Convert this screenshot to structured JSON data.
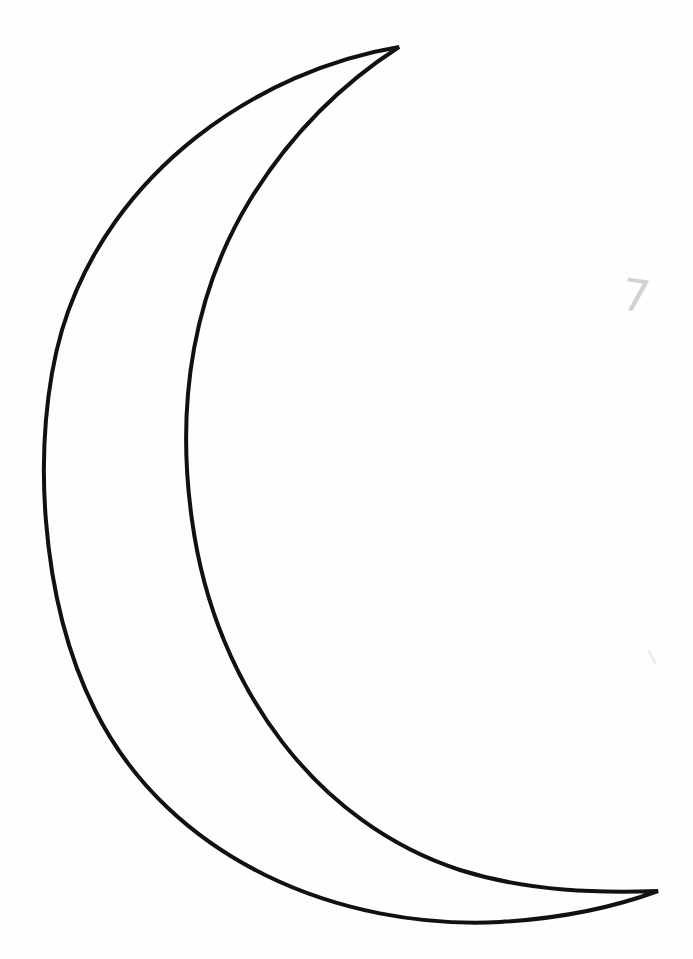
{
  "page": {
    "stroke_color": "#111111",
    "background_color": "#fefefe"
  },
  "annotation": {
    "text": "7",
    "color": "#c4c4c4"
  },
  "shape": {
    "name": "crescent-moon",
    "top_tip": [
      399,
      47
    ],
    "bottom_tip": [
      658,
      891
    ],
    "outer_leftmost_x": 43,
    "inner_leftmost_x": 185
  }
}
